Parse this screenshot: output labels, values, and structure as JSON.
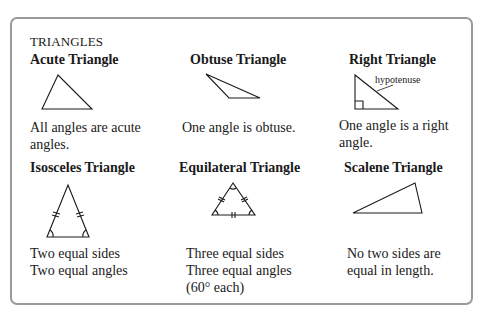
{
  "header": "TRIANGLES",
  "cells": [
    {
      "title": "Acute Triangle",
      "lines": [
        "All angles are acute",
        "angles."
      ]
    },
    {
      "title": "Obtuse Triangle",
      "lines": [
        "One angle is obtuse."
      ]
    },
    {
      "title": "Right Triangle",
      "lines": [
        "One angle is a right",
        "angle."
      ],
      "annotation": "hypotenuse"
    },
    {
      "title": "Isosceles Triangle",
      "lines": [
        "Two equal sides",
        "Two equal angles"
      ]
    },
    {
      "title": "Equilateral Triangle",
      "lines": [
        "Three equal sides",
        "Three equal angles",
        "(60° each)"
      ]
    },
    {
      "title": "Scalene Triangle",
      "lines": [
        "No two sides are",
        "equal in length."
      ]
    }
  ],
  "colors": {
    "stroke": "#1a1a1a",
    "border": "#9a9a9a"
  }
}
